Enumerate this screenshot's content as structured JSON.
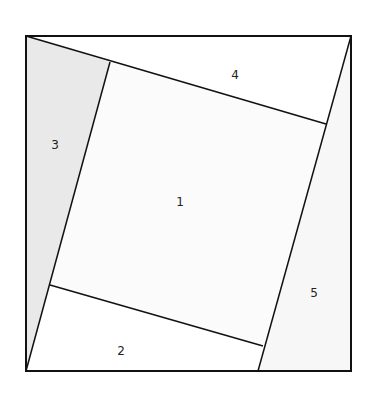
{
  "diagram": {
    "outer_square": {
      "x1": 26,
      "y1": 36,
      "x2": 351,
      "y2": 371
    },
    "colors": {
      "region_1": "#fbfbfb",
      "region_2": "#ffffff",
      "region_3": "#e9e9e9",
      "region_4": "#ffffff",
      "region_5": "#f7f7f7",
      "stroke": "#111111"
    },
    "regions": [
      {
        "id": "1",
        "label": "1",
        "label_x": 180,
        "label_y": 206
      },
      {
        "id": "2",
        "label": "2",
        "label_x": 121,
        "label_y": 355
      },
      {
        "id": "3",
        "label": "3",
        "label_x": 55,
        "label_y": 149
      },
      {
        "id": "4",
        "label": "4",
        "label_x": 235,
        "label_y": 79
      },
      {
        "id": "5",
        "label": "5",
        "label_x": 314,
        "label_y": 297
      }
    ]
  }
}
